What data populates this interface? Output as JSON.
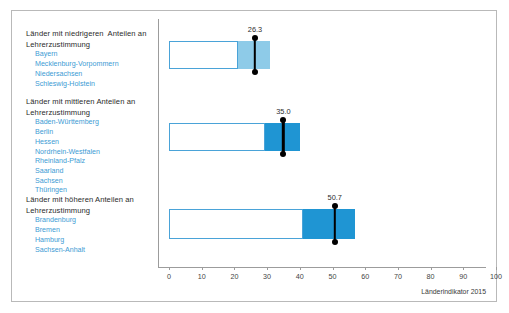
{
  "figure": {
    "source_note": "Länderindikator 2015",
    "accent_blue": "#1f95d3",
    "light_blue": "#8ecbe8",
    "outline_blue": "#4aa3d8",
    "label_blue": "#3d9bd4",
    "axis_gray": "#9c9c9c"
  },
  "groups": [
    {
      "heading": "Länder mit niedrigeren  Anteilen an Lehrerzustimmung",
      "states": [
        "Bayern",
        "Mecklenburg-Vorpommern",
        "Niedersachsen",
        "Schleswig-Holstein"
      ],
      "value_label": "26.3"
    },
    {
      "heading": "Länder mit mittleren Anteilen an Lehrerzustimmung",
      "states": [
        "Baden-Württemberg",
        "Berlin",
        "Hessen",
        "Nordrhein-Westfalen",
        "Rheinland-Pfalz",
        "Saarland",
        "Sachsen",
        "Thüringen"
      ],
      "value_label": "35.0"
    },
    {
      "heading": "Länder mit höheren Anteilen an Lehrerzustimmung",
      "states": [
        "Brandenburg",
        "Bremen",
        "Hamburg",
        "Sachsen-Anhalt"
      ],
      "value_label": "50.7"
    }
  ],
  "axis": {
    "ticks": [
      "0",
      "10",
      "20",
      "30",
      "40",
      "50",
      "60",
      "70",
      "80",
      "90",
      "100"
    ],
    "min": 0,
    "max": 100,
    "step": 10
  },
  "chart_data": {
    "type": "bar",
    "title": "",
    "subtitle": "",
    "xlabel": "",
    "ylabel": "",
    "xlim": [
      0,
      100
    ],
    "grid": false,
    "legend": "none",
    "orientation": "horizontal",
    "annotation": "Länderindikator 2015",
    "categories": [
      "Länder mit niedrigeren Anteilen an Lehrerzustimmung",
      "Länder mit mittleren Anteilen an Lehrerzustimmung",
      "Länder mit höheren Anteilen an Lehrerzustimmung"
    ],
    "series": [
      {
        "name": "Boxbereich hell (Start)",
        "values": [
          0,
          0,
          0
        ]
      },
      {
        "name": "Boxbereich hell (Ende)",
        "values": [
          21.0,
          29.5,
          41.0
        ]
      },
      {
        "name": "Boxbereich gefüllt (Ende)",
        "values": [
          31.0,
          40.0,
          57.0
        ]
      },
      {
        "name": "Mittelwert",
        "values": [
          26.3,
          35.0,
          50.7
        ]
      }
    ],
    "point_labels": [
      "26.3",
      "35.0",
      "50.7"
    ],
    "bar_colors": [
      "#8ecbe8",
      "#1f95d3",
      "#1f95d3"
    ]
  }
}
